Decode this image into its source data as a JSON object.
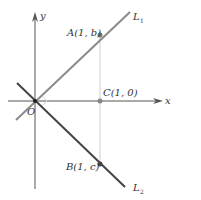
{
  "figure": {
    "axes": {
      "x_label": "x",
      "y_label": "y",
      "origin_label": "O"
    },
    "lines": [
      {
        "name": "L",
        "subscript": "1",
        "color": "#8a8a8a",
        "description": "line through origin with positive slope"
      },
      {
        "name": "L",
        "subscript": "2",
        "color": "#444444",
        "description": "line through origin with negative slope"
      }
    ],
    "points": {
      "A": {
        "label": "A(1, b)"
      },
      "B": {
        "label": "B(1, c)"
      },
      "C": {
        "label": "C(1, 0)"
      }
    },
    "annotations": {
      "right_angle_at_origin": true,
      "vertical_guide_x": 1
    },
    "colors": {
      "axis": "#555555",
      "guide": "#cfcfcf",
      "point": "#777777",
      "right_angle": "#d8d8d8"
    }
  }
}
